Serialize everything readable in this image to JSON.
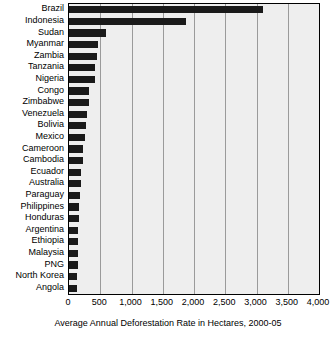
{
  "chart_data": {
    "type": "bar",
    "orientation": "horizontal",
    "title": "",
    "xlabel": "Average Annual Deforestation Rate in Hectares, 2000-05",
    "ylabel": "",
    "xlim": [
      0,
      4000
    ],
    "ylim": null,
    "grid": true,
    "legend": false,
    "xticks": [
      0,
      500,
      1000,
      1500,
      2000,
      2500,
      3000,
      3500,
      4000
    ],
    "xticklabels": [
      "0",
      "500",
      "1,000",
      "1,500",
      "2,000",
      "2,500",
      "3,000",
      "3,500",
      "4,000"
    ],
    "bar_color": "#1a1a1a",
    "plot_background": "#eeeeee",
    "categories": [
      "Brazil",
      "Indonesia",
      "Sudan",
      "Myanmar",
      "Zambia",
      "Tanzania",
      "Nigeria",
      "Congo",
      "Zimbabwe",
      "Venezuela",
      "Bolivia",
      "Mexico",
      "Cameroon",
      "Cambodia",
      "Ecuador",
      "Australia",
      "Paraguay",
      "Philippines",
      "Honduras",
      "Argentina",
      "Ethiopia",
      "Malaysia",
      "PNG",
      "North Korea",
      "Angola"
    ],
    "values": [
      3103,
      1871,
      589,
      466,
      445,
      412,
      410,
      319,
      313,
      288,
      270,
      260,
      220,
      219,
      198,
      193,
      179,
      157,
      156,
      149,
      141,
      140,
      139,
      127,
      125
    ]
  }
}
